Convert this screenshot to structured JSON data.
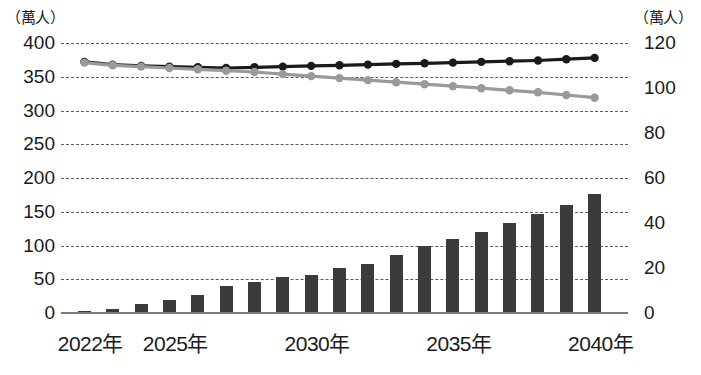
{
  "axes": {
    "left_unit": "（萬人）",
    "right_unit": "（萬人）",
    "left_ticks": [
      "400",
      "350",
      "300",
      "250",
      "200",
      "150",
      "100",
      "50",
      "0"
    ],
    "right_ticks": [
      "120",
      "100",
      "80",
      "60",
      "40",
      "20",
      "0"
    ],
    "x_ticks": [
      "2022年",
      "2025年",
      "2030年",
      "2035年",
      "2040年"
    ]
  },
  "chart_data": {
    "type": "bar",
    "title": "",
    "xlabel": "",
    "ylabel": "（萬人）",
    "y2label": "（萬人）",
    "ylim": [
      0,
      400
    ],
    "y2lim": [
      0,
      120
    ],
    "ytick_step": 50,
    "y2tick_step": 20,
    "grid": true,
    "legend": "none",
    "categories": [
      "2022年",
      "2023年",
      "2024年",
      "2025年",
      "2026年",
      "2027年",
      "2028年",
      "2029年",
      "2030年",
      "2031年",
      "2032年",
      "2033年",
      "2034年",
      "2035年",
      "2036年",
      "2037年",
      "2038年",
      "2039年",
      "2040年"
    ],
    "x_tick_categories": [
      "2022年",
      "2025年",
      "2030年",
      "2035年",
      "2040年"
    ],
    "series": [
      {
        "name": "bar-series",
        "type": "bar",
        "axis": "right",
        "color": "#3b3b3b",
        "values": [
          1,
          2,
          4,
          6,
          8,
          12,
          14,
          16,
          17,
          20,
          22,
          26,
          30,
          33,
          36,
          40,
          44,
          48,
          53
        ]
      },
      {
        "name": "dark-line-series",
        "type": "line",
        "axis": "left",
        "color": "#1a1a1a",
        "marker": "circle",
        "values": [
          372,
          368,
          366,
          365,
          364,
          363,
          364,
          365,
          366,
          367,
          368,
          369,
          370,
          371,
          372,
          373,
          374,
          376,
          378
        ]
      },
      {
        "name": "gray-line-series",
        "type": "line",
        "axis": "left",
        "color": "#9a9a9a",
        "marker": "circle",
        "values": [
          371,
          367,
          365,
          363,
          361,
          359,
          357,
          354,
          351,
          348,
          345,
          342,
          339,
          336,
          333,
          330,
          327,
          323,
          319
        ]
      }
    ]
  }
}
